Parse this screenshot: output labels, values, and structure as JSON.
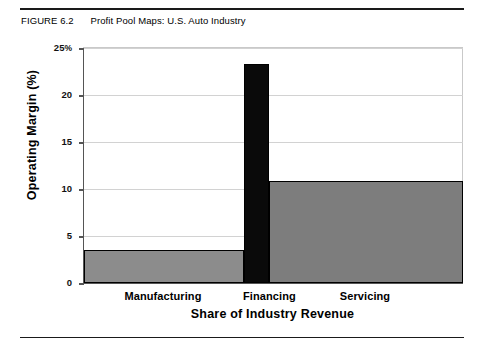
{
  "figure": {
    "number": "FIGURE 6.2",
    "title": "Profit Pool Maps: U.S. Auto Industry"
  },
  "chart_data": {
    "type": "bar",
    "variant": "variable-width-bar (profit pool map / Marimekko-style)",
    "title": "Profit Pool Maps: U.S. Auto Industry",
    "xlabel": "Share of Industry Revenue",
    "ylabel": "Operating Margin (%)",
    "categories": [
      "Manufacturing",
      "Financing",
      "Servicing"
    ],
    "values": [
      3.5,
      23.3,
      10.8
    ],
    "widths_pct": [
      42.2,
      6.6,
      51.2
    ],
    "series": [
      {
        "name": "Operating Margin (%)",
        "values": [
          3.5,
          23.3,
          10.8
        ]
      }
    ],
    "bar_colors": [
      "#8c8c8c",
      "#0a0a0a",
      "#7d7d7d"
    ],
    "ylim": [
      0,
      25
    ],
    "yticks": [
      0,
      5,
      10,
      15,
      20,
      25
    ],
    "ytick_labels": [
      "0",
      "5",
      "10",
      "15",
      "20",
      "25%"
    ],
    "grid": true,
    "grid_axis": "y",
    "legend": false,
    "legend_position": "none"
  },
  "axes": {
    "y": {
      "unit_suffix": "%",
      "ticks": [
        {
          "value": 25,
          "label": "25",
          "suffix": "%"
        },
        {
          "value": 20,
          "label": "20",
          "suffix": ""
        },
        {
          "value": 15,
          "label": "15",
          "suffix": ""
        },
        {
          "value": 10,
          "label": "10",
          "suffix": ""
        },
        {
          "value": 5,
          "label": "5",
          "suffix": ""
        },
        {
          "value": 0,
          "label": "0",
          "suffix": ""
        }
      ],
      "title": "Operating Margin (%)"
    },
    "x": {
      "title": "Share of Industry Revenue",
      "categories": [
        "Manufacturing",
        "Financing",
        "Servicing"
      ]
    }
  },
  "colors": {
    "manufacturing_fill": "#8c8c8c",
    "financing_fill": "#0a0a0a",
    "servicing_fill": "#7d7d7d",
    "bar_outline": "#000000",
    "gridline": "#d2d2d2",
    "axis": "#555555",
    "rule": "#1a1a1a"
  }
}
